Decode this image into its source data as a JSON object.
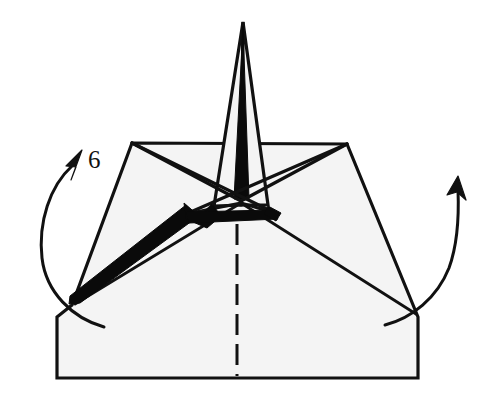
{
  "diagram": {
    "step_label": "6",
    "colors": {
      "background": "#ffffff",
      "paper_fill": "#f4f4f4",
      "ink": "#111111",
      "shadow_black": "#0a0a0a"
    },
    "canvas": {
      "width": 492,
      "height": 408
    },
    "elements": {
      "base_shape_name": "trapezoid-body",
      "spike_name": "center-spike",
      "star_name": "center-star-creases",
      "center_crease_name": "center-dashed-crease",
      "left_arrow_name": "left-fold-arrow",
      "right_arrow_name": "right-fold-arrow",
      "black_band_name": "shaded-fold-band"
    },
    "geometry": {
      "body_outline": "132,143 347,144 418,318 418,378 57,378 57,317 72,305",
      "bottom_edge_y": 378,
      "left_vertex": "72,305",
      "right_vertex": "418,315",
      "top_left_vertex": "132,143",
      "top_right_vertex": "347,144",
      "spike_apex": "243,22",
      "center_vertex": "240,200",
      "dashed_crease_x": 237,
      "dashed_crease_from_y": 224,
      "dashed_crease_to_y": 376
    },
    "annotations": {
      "step_number_x": 88,
      "step_number_y": 168
    }
  }
}
